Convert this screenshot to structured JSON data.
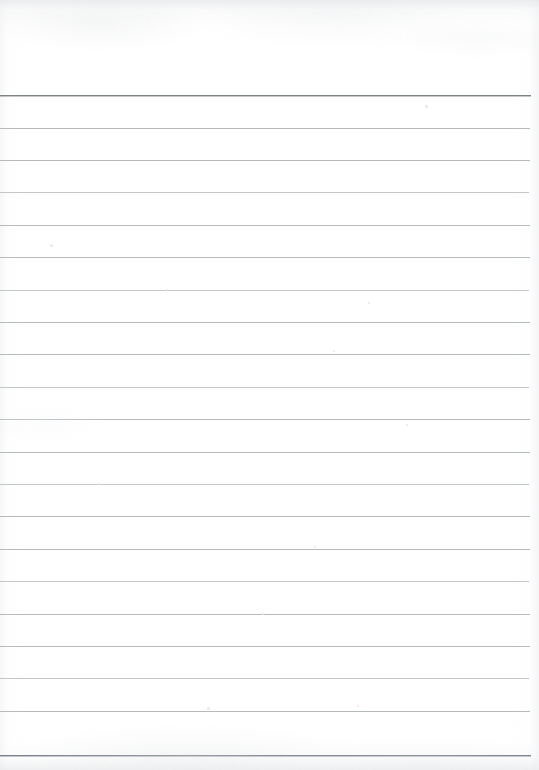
{
  "document": {
    "kind": "scanned-lined-notepad-page",
    "title": "Blank Ruled Notepad Page",
    "page_width": 539,
    "page_height": 770,
    "background_color": "#ffffff",
    "rule_color": "#b6babe",
    "rule_color_strong": "#7e8387",
    "header_text": "",
    "body_text": "",
    "margin_left_px": 0,
    "rule_right_edge_px": 530,
    "header_blank_height_px": 95,
    "line_spacing_px": 32.4,
    "line_count": 21
  },
  "rules": [
    {
      "index": 1,
      "y": 95,
      "x_start": 0,
      "x_end": 531,
      "weight": "strong",
      "text": ""
    },
    {
      "index": 2,
      "y": 128,
      "x_start": 0,
      "x_end": 530,
      "weight": "normal",
      "text": ""
    },
    {
      "index": 3,
      "y": 160,
      "x_start": 0,
      "x_end": 530,
      "weight": "normal",
      "text": ""
    },
    {
      "index": 4,
      "y": 192,
      "x_start": 0,
      "x_end": 529,
      "weight": "light",
      "text": ""
    },
    {
      "index": 5,
      "y": 225,
      "x_start": 0,
      "x_end": 530,
      "weight": "normal",
      "text": ""
    },
    {
      "index": 6,
      "y": 257,
      "x_start": 0,
      "x_end": 530,
      "weight": "normal",
      "text": ""
    },
    {
      "index": 7,
      "y": 290,
      "x_start": 0,
      "x_end": 529,
      "weight": "light",
      "text": ""
    },
    {
      "index": 8,
      "y": 322,
      "x_start": 0,
      "x_end": 530,
      "weight": "normal",
      "text": ""
    },
    {
      "index": 9,
      "y": 354,
      "x_start": 0,
      "x_end": 530,
      "weight": "normal",
      "text": ""
    },
    {
      "index": 10,
      "y": 387,
      "x_start": 0,
      "x_end": 529,
      "weight": "light",
      "text": ""
    },
    {
      "index": 11,
      "y": 419,
      "x_start": 0,
      "x_end": 530,
      "weight": "normal",
      "text": ""
    },
    {
      "index": 12,
      "y": 452,
      "x_start": 0,
      "x_end": 530,
      "weight": "normal",
      "text": ""
    },
    {
      "index": 13,
      "y": 484,
      "x_start": 0,
      "x_end": 529,
      "weight": "light",
      "text": ""
    },
    {
      "index": 14,
      "y": 516,
      "x_start": 0,
      "x_end": 530,
      "weight": "normal",
      "text": ""
    },
    {
      "index": 15,
      "y": 549,
      "x_start": 0,
      "x_end": 530,
      "weight": "normal",
      "text": ""
    },
    {
      "index": 16,
      "y": 581,
      "x_start": 0,
      "x_end": 529,
      "weight": "light",
      "text": ""
    },
    {
      "index": 17,
      "y": 614,
      "x_start": 0,
      "x_end": 530,
      "weight": "normal",
      "text": ""
    },
    {
      "index": 18,
      "y": 646,
      "x_start": 0,
      "x_end": 530,
      "weight": "normal",
      "text": ""
    },
    {
      "index": 19,
      "y": 678,
      "x_start": 0,
      "x_end": 529,
      "weight": "light",
      "text": ""
    },
    {
      "index": 20,
      "y": 711,
      "x_start": 0,
      "x_end": 530,
      "weight": "normal",
      "text": ""
    },
    {
      "index": 21,
      "y": 755,
      "x_start": 0,
      "x_end": 531,
      "weight": "strong",
      "text": ""
    }
  ],
  "specks": [
    {
      "x": 425,
      "y": 105,
      "size": 3
    },
    {
      "x": 50,
      "y": 244,
      "size": 3
    },
    {
      "x": 166,
      "y": 289,
      "size": 2
    },
    {
      "x": 368,
      "y": 302,
      "size": 2
    },
    {
      "x": 333,
      "y": 350,
      "size": 2
    },
    {
      "x": 406,
      "y": 424,
      "size": 2
    },
    {
      "x": 98,
      "y": 483,
      "size": 2
    },
    {
      "x": 314,
      "y": 546,
      "size": 2
    },
    {
      "x": 207,
      "y": 707,
      "size": 3
    },
    {
      "x": 357,
      "y": 705,
      "size": 2
    },
    {
      "x": 262,
      "y": 613,
      "size": 2
    }
  ]
}
